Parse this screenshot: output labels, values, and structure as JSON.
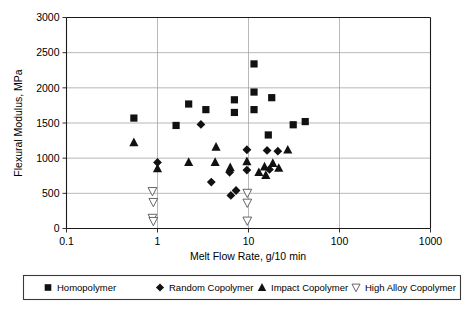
{
  "chart_data": {
    "type": "scatter",
    "title": "",
    "xlabel": "Melt Flow Rate, g/10 min",
    "ylabel": "Flexural Modulus, MPa",
    "xscale": "log",
    "xlim": [
      0.1,
      1000
    ],
    "ylim": [
      0,
      3000
    ],
    "xticks": [
      "0.1",
      "1",
      "10",
      "100",
      "1000"
    ],
    "xtick_values": [
      0.1,
      1,
      10,
      100,
      1000
    ],
    "yticks": [
      "0",
      "500",
      "1000",
      "1500",
      "2000",
      "2500",
      "3000"
    ],
    "ytick_values": [
      0,
      500,
      1000,
      1500,
      2000,
      2500,
      3000
    ],
    "grid": true,
    "legend_position": "below",
    "series": [
      {
        "name": "Homopolymer",
        "marker": "filled-square",
        "color": "#111111",
        "points": [
          [
            0.55,
            1570
          ],
          [
            1.6,
            1465
          ],
          [
            2.2,
            1770
          ],
          [
            3.4,
            1690
          ],
          [
            7.0,
            1830
          ],
          [
            7.0,
            1650
          ],
          [
            11.5,
            2340
          ],
          [
            11.5,
            1940
          ],
          [
            11.5,
            1690
          ],
          [
            18.0,
            1860
          ],
          [
            16.5,
            1330
          ],
          [
            31.0,
            1475
          ],
          [
            42.0,
            1520
          ]
        ]
      },
      {
        "name": "Random Copolymer",
        "marker": "filled-diamond",
        "color": "#111111",
        "points": [
          [
            1.0,
            940
          ],
          [
            3.0,
            1480
          ],
          [
            3.9,
            660
          ],
          [
            6.2,
            800
          ],
          [
            6.4,
            470
          ],
          [
            7.3,
            540
          ],
          [
            9.6,
            1120
          ],
          [
            9.6,
            830
          ],
          [
            16.0,
            1110
          ],
          [
            17.0,
            840
          ],
          [
            21.0,
            1100
          ]
        ]
      },
      {
        "name": "Impact Copolymer",
        "marker": "filled-triangle",
        "color": "#111111",
        "points": [
          [
            0.55,
            1225
          ],
          [
            1.0,
            855
          ],
          [
            2.2,
            945
          ],
          [
            4.4,
            1160
          ],
          [
            4.3,
            945
          ],
          [
            6.3,
            870
          ],
          [
            9.6,
            955
          ],
          [
            13.0,
            800
          ],
          [
            15.0,
            880
          ],
          [
            15.5,
            760
          ],
          [
            18.5,
            930
          ],
          [
            21.5,
            860
          ],
          [
            27.0,
            1120
          ]
        ]
      },
      {
        "name": "High Alloy Copolymer",
        "marker": "open-triangle-down",
        "color": "#ffffff",
        "points": [
          [
            0.88,
            530
          ],
          [
            0.9,
            375
          ],
          [
            0.88,
            150
          ],
          [
            0.9,
            105
          ],
          [
            9.7,
            505
          ],
          [
            9.7,
            365
          ],
          [
            9.7,
            110
          ]
        ]
      }
    ]
  },
  "axes": {
    "y_title": "Flexural Modulus, MPa",
    "x_title": "Melt Flow Rate, g/10 min"
  },
  "legend": {
    "items": [
      {
        "label": "Homopolymer",
        "marker": "filled-square"
      },
      {
        "label": "Random Copolymer",
        "marker": "filled-diamond"
      },
      {
        "label": "Impact Copolymer",
        "marker": "filled-triangle"
      },
      {
        "label": "High Alloy Copolymer",
        "marker": "open-triangle-down"
      }
    ]
  }
}
